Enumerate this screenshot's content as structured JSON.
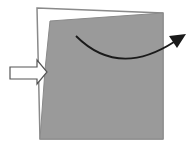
{
  "diagram": {
    "colors": {
      "background": "#ffffff",
      "fill": "#9a9a9a",
      "outline": "#8a8a8a",
      "arrow": "#1a1a1a",
      "push_arrow_stroke": "#555555"
    },
    "shapes": {
      "original_square": "37,8 163,13 163,139 40,139",
      "deformed_shape": "50,21 163,13 163,139 40,139 45,70",
      "push_arrow": "10,67 37,67 37,60 47,72 37,84 37,79 10,79",
      "rotation_arrow_path": "M 76 36 Q 118 78 174 42",
      "rotation_arrowhead": "186,34 169,36 177,48"
    }
  }
}
